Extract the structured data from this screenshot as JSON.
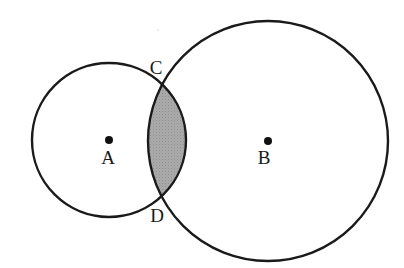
{
  "figure": {
    "background_color": "#ffffff",
    "stroke_color": "#1a1a1a",
    "stroke_width": 2.4,
    "shaded_region": {
      "name": "lens-intersection",
      "fill_color": "#a8a8a8",
      "texture": "halftone-dots",
      "description": "Region common to circle A and circle B, bounded by points C and D"
    },
    "circles": [
      {
        "id": "A",
        "label": "A",
        "center_x": 109,
        "center_y": 140,
        "radius": 77,
        "center_dot_radius": 4,
        "label_x": 108,
        "label_y": 164
      },
      {
        "id": "B",
        "label": "B",
        "center_x": 268,
        "center_y": 141,
        "radius": 120,
        "center_dot_radius": 4,
        "label_x": 264,
        "label_y": 164
      }
    ],
    "intersection_points": [
      {
        "id": "C",
        "label": "C",
        "x": 160,
        "y": 84,
        "label_x": 156,
        "label_y": 74
      },
      {
        "id": "D",
        "label": "D",
        "x": 160,
        "y": 198,
        "label_x": 157,
        "label_y": 222
      }
    ],
    "artifacts": [
      {
        "name": "scan-speck",
        "x": 158,
        "y": 30,
        "radius": 1.2,
        "color": "#e9e9e9"
      }
    ]
  }
}
